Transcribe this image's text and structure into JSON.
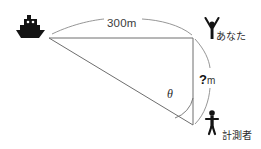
{
  "diagram": {
    "type": "geometry-trigonometry-illustration",
    "background_color": "#ffffff",
    "line_color": "#6e6e6e",
    "icon_color": "#141414",
    "labels": {
      "distance": "300m",
      "height_question": "?",
      "height_unit": "m",
      "angle": "θ",
      "person_top": "あなた",
      "person_bottom": "計測者"
    },
    "icons": {
      "boat": "boat-icon",
      "person_arms_up": "person-arms-raised-icon",
      "person_standing": "person-standing-icon"
    },
    "geometry": {
      "boat_vertex": [
        49,
        38
      ],
      "top_right_vertex": [
        193,
        38
      ],
      "bottom_right_vertex": [
        193,
        125
      ],
      "horizontal_length_label": "300m",
      "vertical_length_label": "?m",
      "angle_at_bottom_right": "θ"
    }
  }
}
